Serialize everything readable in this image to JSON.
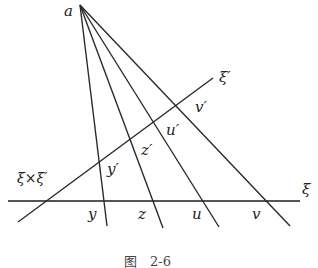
{
  "figure": {
    "caption": "图　2-6",
    "apex": {
      "label": "a",
      "x": 80,
      "y": 5
    },
    "lines": {
      "xi": {
        "label": "ξ",
        "x1": 8,
        "y1": 201,
        "x2": 300,
        "y2": 201
      },
      "xi_prime": {
        "label": "ξ′",
        "x1": 18,
        "y1": 222,
        "x2": 213,
        "y2": 78
      }
    },
    "intersection_label": "ξ×ξ′",
    "rays": [
      {
        "name": "y",
        "end_x": 107,
        "end_y": 226
      },
      {
        "name": "z",
        "end_x": 163,
        "end_y": 228
      },
      {
        "name": "u",
        "end_x": 219,
        "end_y": 227
      },
      {
        "name": "v",
        "end_x": 290,
        "end_y": 226
      }
    ],
    "points_on_xi": [
      "y",
      "z",
      "u",
      "v"
    ],
    "points_on_xi_prime": [
      "y′",
      "z′",
      "u′",
      "v′"
    ]
  }
}
